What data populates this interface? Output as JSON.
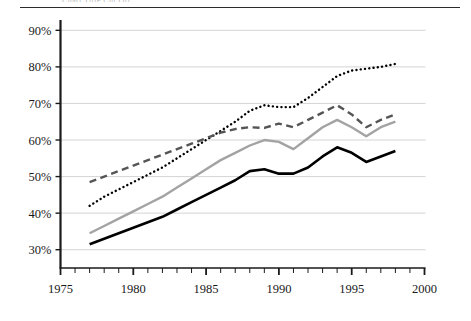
{
  "figure": {
    "top_caption_partial": "Chart Title Cut Off",
    "background_color": "#ffffff",
    "rule_color": "#2b2b2b"
  },
  "chart_data": {
    "type": "line",
    "title": "",
    "subtitle": "",
    "xlabel": "",
    "ylabel": "",
    "xlim": [
      1975,
      2000
    ],
    "ylim": [
      25,
      92
    ],
    "grid": true,
    "grid_axis": "y",
    "legend_position": "none",
    "x_ticks": [
      1975,
      1980,
      1985,
      1990,
      1995,
      2000
    ],
    "x_tick_labels": [
      "1975",
      "1980",
      "1985",
      "1990",
      "1995",
      "2000"
    ],
    "x_minor_tick_interval": 1,
    "y_ticks": [
      30,
      40,
      50,
      60,
      70,
      80,
      90
    ],
    "y_tick_labels": [
      "30%",
      "40%",
      "50%",
      "60%",
      "70%",
      "80%",
      "90%"
    ],
    "x": [
      1977,
      1978,
      1979,
      1980,
      1981,
      1982,
      1983,
      1984,
      1985,
      1986,
      1987,
      1988,
      1989,
      1990,
      1991,
      1992,
      1993,
      1994,
      1995,
      1996,
      1997,
      1998
    ],
    "series": [
      {
        "name": "dotted-black-series",
        "style": "dotted",
        "color": "#000000",
        "width": 2.4,
        "values": [
          42.0,
          44.5,
          46.5,
          48.5,
          50.5,
          52.5,
          55.0,
          57.5,
          60.0,
          62.5,
          65.0,
          68.0,
          69.5,
          69.0,
          69.0,
          71.5,
          74.5,
          77.5,
          79.0,
          79.5,
          80.0,
          80.8
        ]
      },
      {
        "name": "dashed-gray-series",
        "style": "dashed",
        "color": "#555555",
        "width": 2.4,
        "values": [
          48.5,
          50.0,
          51.5,
          53.0,
          54.5,
          56.0,
          57.5,
          59.0,
          60.5,
          62.0,
          63.0,
          63.5,
          63.3,
          64.5,
          63.5,
          65.5,
          67.5,
          69.5,
          67.0,
          63.5,
          65.5,
          67.0
        ]
      },
      {
        "name": "solid-gray-series",
        "style": "solid",
        "color": "#a3a3a3",
        "width": 2.4,
        "values": [
          34.5,
          36.5,
          38.5,
          40.5,
          42.5,
          44.5,
          47.0,
          49.5,
          52.0,
          54.5,
          56.5,
          58.5,
          60.0,
          59.5,
          57.5,
          60.5,
          63.5,
          65.5,
          63.5,
          61.0,
          63.5,
          65.0
        ]
      },
      {
        "name": "solid-black-series",
        "style": "solid",
        "color": "#000000",
        "width": 2.6,
        "values": [
          31.5,
          33.0,
          34.5,
          36.0,
          37.5,
          39.0,
          41.0,
          43.0,
          45.0,
          47.0,
          49.0,
          51.5,
          52.0,
          50.8,
          50.8,
          52.5,
          55.5,
          58.0,
          56.5,
          54.0,
          55.5,
          57.0
        ]
      }
    ]
  }
}
